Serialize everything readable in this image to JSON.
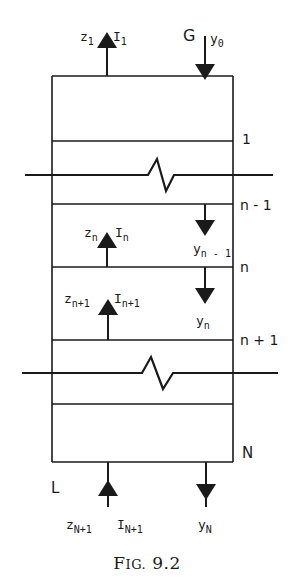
{
  "figure": {
    "caption_prefix": "F",
    "caption_smallcaps": "IG.",
    "caption_number": " 9.2",
    "column": {
      "stream_labels": {
        "gas_in": "G",
        "liquid_out_bottom": "L"
      },
      "stage_labels": [
        "1",
        "n - 1",
        "n",
        "n + 1",
        "N"
      ],
      "flows": {
        "top_up": {
          "z": "z",
          "z_sub": "1",
          "x": "I",
          "x_sub": "1"
        },
        "top_down": {
          "y": "y",
          "y_sub": "0"
        },
        "stage_n_up": {
          "z": "z",
          "z_sub": "n",
          "x": "I",
          "x_sub": "n"
        },
        "stage_n_down": {
          "y": "y",
          "y_sub": "n - 1"
        },
        "stage_n1_up": {
          "z": "z",
          "z_sub": "n+1",
          "x": "I",
          "x_sub": "n+1"
        },
        "stage_n1_down": {
          "y": "y",
          "y_sub": "n"
        },
        "bottom_up": {
          "z": "z",
          "z_sub": "N+1",
          "x": "I",
          "x_sub": "N+1"
        },
        "bottom_down": {
          "y": "y",
          "y_sub": "N"
        }
      }
    },
    "colors": {
      "ink": "#1a1a1a",
      "background": "#ffffff"
    }
  }
}
